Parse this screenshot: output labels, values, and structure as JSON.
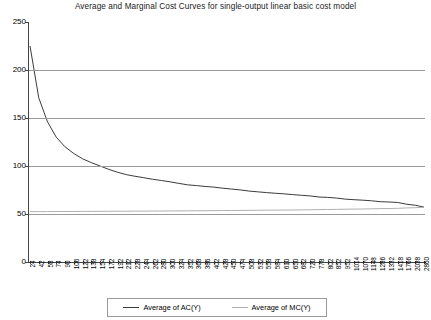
{
  "chart_data": {
    "type": "line",
    "title": "Average and Marginal Cost Curves for single-output linear basic cost model",
    "xlabel": "",
    "ylabel": "",
    "ylim": [
      0,
      250
    ],
    "yticks": [
      0,
      50,
      100,
      150,
      200,
      250
    ],
    "grid": true,
    "gridlines_at": [
      50,
      100,
      150,
      200
    ],
    "legend_position": "bottom",
    "categories": [
      24,
      42,
      58,
      74,
      90,
      106,
      122,
      138,
      154,
      172,
      192,
      212,
      228,
      244,
      262,
      280,
      300,
      324,
      352,
      368,
      386,
      402,
      428,
      450,
      474,
      508,
      532,
      558,
      584,
      610,
      650,
      682,
      720,
      778,
      802,
      852,
      952,
      1014,
      1070,
      1148,
      1286,
      1332,
      1418,
      1766,
      2038,
      2860
    ],
    "series": [
      {
        "name": "Average of AC(Y)",
        "color": "#3b3b3b",
        "values": [
          225.0,
          171.0,
          146.0,
          130.0,
          120.0,
          113.0,
          107.5,
          103.5,
          100.0,
          96.5,
          93.5,
          91.0,
          89.3,
          87.8,
          86.2,
          84.9,
          83.5,
          81.9,
          80.4,
          79.6,
          78.7,
          78.0,
          76.9,
          76.0,
          75.1,
          73.9,
          73.1,
          72.3,
          71.6,
          71.0,
          70.2,
          69.5,
          68.8,
          67.7,
          67.3,
          66.6,
          65.5,
          64.9,
          64.4,
          63.8,
          62.8,
          62.5,
          62.0,
          60.2,
          59.1,
          57.2
        ]
      },
      {
        "name": "Average of MC(Y)",
        "color": "#b0b0b0",
        "values": [
          52.5,
          52.5,
          52.5,
          52.6,
          52.6,
          52.6,
          52.7,
          52.7,
          52.8,
          52.8,
          52.9,
          52.9,
          53.0,
          53.0,
          53.1,
          53.1,
          53.2,
          53.2,
          53.3,
          53.4,
          53.4,
          53.5,
          53.6,
          53.6,
          53.7,
          53.8,
          53.9,
          54.0,
          54.0,
          54.1,
          54.2,
          54.3,
          54.4,
          54.6,
          54.7,
          54.8,
          55.0,
          55.1,
          55.2,
          55.4,
          55.6,
          55.7,
          55.9,
          56.3,
          56.6,
          57.0
        ]
      }
    ]
  },
  "legend": {
    "entries": [
      {
        "label": "Average of AC(Y)",
        "color": "#3b3b3b"
      },
      {
        "label": "Average of MC(Y)",
        "color": "#b0b0b0"
      }
    ]
  },
  "colors": {
    "ac_line": "#3b3b3b",
    "mc_line": "#b0b0b0",
    "gridline": "#9a9a9a",
    "axis": "#444444",
    "background": "#ffffff"
  }
}
